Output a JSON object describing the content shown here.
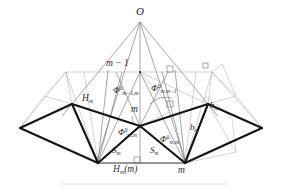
{
  "figure": {
    "background_color": "#ffffff",
    "thick_line_color": "#1a1a1a",
    "thin_line_color": "#6e6e6e",
    "hair_line_color": "#9a9a9a",
    "text_color": "#2b2b2b",
    "width": 282,
    "height": 189
  },
  "labels": {
    "apex": {
      "text": "O",
      "x": 138,
      "y": 11
    },
    "node_m_minus_1": {
      "base": "m",
      "minus": " − 1",
      "x": 110,
      "y": 64
    },
    "node_m_mid": {
      "base": "m",
      "x": 134,
      "y": 110
    },
    "node_m_bottom": {
      "base": "m",
      "x": 180,
      "y": 171
    },
    "H_m": {
      "base": "H",
      "sub": "m",
      "x": 85,
      "y": 99
    },
    "H_m_of_m": {
      "base": "H",
      "sub": "m",
      "paren": "(m)",
      "x": 122,
      "y": 170
    },
    "phi_upper_left": {
      "base": "Φ",
      "sup": "0",
      "sub": "m−1,m",
      "x": 118,
      "y": 89
    },
    "phi_upper_right": {
      "base": "Φ",
      "sup": "0",
      "sub": "m,m−1",
      "x": 155,
      "y": 88
    },
    "phi_lower_left": {
      "base": "Φ",
      "sup": "0",
      "sub": "m,m",
      "x": 123,
      "y": 131
    },
    "phi_lower_right": {
      "base": "Φ",
      "sup": "0",
      "sub": "m,m",
      "x": 165,
      "y": 138
    },
    "S_m_left": {
      "base": "S",
      "sub": "m",
      "x": 115,
      "y": 150
    },
    "S_m_right": {
      "base": "S",
      "sub": "m",
      "x": 153,
      "y": 150
    },
    "b_m": {
      "base": "b",
      "sub": "m",
      "x": 213,
      "y": 105
    },
    "b_s": {
      "base": "b",
      "sub": "s",
      "x": 193,
      "y": 127
    }
  },
  "geometry": {
    "apex_point": {
      "x": 140,
      "y": 22
    },
    "baseline": {
      "x1": 98,
      "y1": 163,
      "x2": 185,
      "y2": 163
    },
    "thick_polygon_left": [
      [
        20,
        128
      ],
      [
        72,
        104
      ],
      [
        140,
        126
      ],
      [
        98,
        163
      ]
    ],
    "thick_polygon_right": [
      [
        185,
        163
      ],
      [
        140,
        126
      ],
      [
        208,
        104
      ],
      [
        262,
        128
      ]
    ],
    "thick_edges": [
      {
        "from": [
          20,
          128
        ],
        "to": [
          72,
          104
        ]
      },
      {
        "from": [
          72,
          104
        ],
        "to": [
          140,
          126
        ]
      },
      {
        "from": [
          140,
          126
        ],
        "to": [
          98,
          163
        ]
      },
      {
        "from": [
          98,
          163
        ],
        "to": [
          20,
          128
        ]
      },
      {
        "from": [
          72,
          104
        ],
        "to": [
          98,
          163
        ]
      },
      {
        "from": [
          140,
          126
        ],
        "to": [
          185,
          163
        ]
      },
      {
        "from": [
          140,
          126
        ],
        "to": [
          208,
          104
        ]
      },
      {
        "from": [
          208,
          104
        ],
        "to": [
          262,
          128
        ]
      },
      {
        "from": [
          262,
          128
        ],
        "to": [
          185,
          163
        ]
      },
      {
        "from": [
          208,
          104
        ],
        "to": [
          185,
          163
        ]
      }
    ],
    "fan_lines_from_apex": [
      {
        "to": [
          68,
          80
        ]
      },
      {
        "to": [
          102,
          72
        ]
      },
      {
        "to": [
          140,
          126
        ]
      },
      {
        "to": [
          172,
          72
        ]
      },
      {
        "to": [
          208,
          80
        ]
      }
    ],
    "thin_chord_upper": {
      "x1": 68,
      "y1": 72,
      "x2": 212,
      "y2": 72
    },
    "vertical_axis": {
      "x": 140,
      "y1": 22,
      "y2": 163
    },
    "right_angle_marks": [
      {
        "x": 170,
        "y": 66,
        "size": 6
      },
      {
        "x": 170,
        "y": 106,
        "size": 6
      },
      {
        "x": 134,
        "y": 157,
        "size": 6
      },
      {
        "x": 202,
        "y": 66,
        "size": 5
      }
    ]
  }
}
